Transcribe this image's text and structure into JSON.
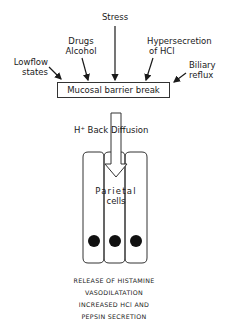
{
  "causes": {
    "stress": "Stress",
    "drugs_line1": "Drugs",
    "drugs_line2": "Alcohol",
    "hyper_line1": "Hypersecretion",
    "hyper_line2": "of HCl",
    "lowflow_line1": "Lowflow",
    "lowflow_line2": "states",
    "biliary_line1": "Biliary",
    "biliary_line2": "reflux"
  },
  "central_box": "Mucosal barrier break",
  "back_diffusion": "H⁺ Back Diffusion",
  "cells_label": {
    "line1": "Parietal",
    "line2": "cells"
  },
  "cells": {
    "count": 3,
    "nuclei": 3
  },
  "outcomes": [
    "RELEASE OF HISTAMINE",
    "VASODILATATION",
    "INCREASED HCl AND",
    "PEPSIN SECRETION"
  ],
  "colors": {
    "ink": "#1a1a1a",
    "background": "#ffffff"
  }
}
